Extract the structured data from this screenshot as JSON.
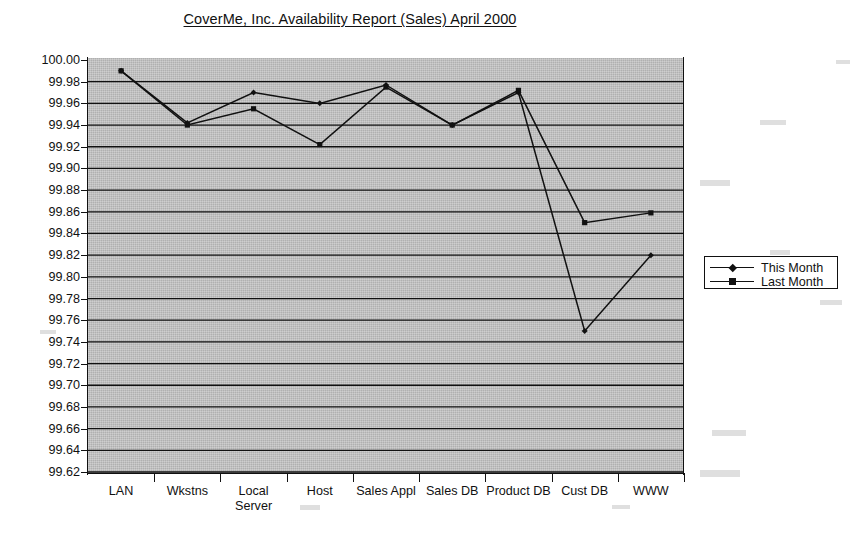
{
  "chart_data": {
    "type": "line",
    "title": "CoverMe, Inc. Availability Report (Sales) April 2000",
    "xlabel": "",
    "ylabel": "",
    "ylim": [
      99.62,
      100.0
    ],
    "ytick_step": 0.02,
    "grid": true,
    "legend_position": "right",
    "categories": [
      "LAN",
      "Wkstns",
      "Local Server",
      "Host",
      "Sales Appl",
      "Sales DB",
      "Product DB",
      "Cust DB",
      "WWW"
    ],
    "category_lines": [
      [
        "LAN"
      ],
      [
        "Wkstns"
      ],
      [
        "Local",
        "Server"
      ],
      [
        "Host"
      ],
      [
        "Sales Appl"
      ],
      [
        "Sales DB"
      ],
      [
        "Product DB"
      ],
      [
        "Cust DB"
      ],
      [
        "WWW"
      ]
    ],
    "ytick_labels": [
      "100.00",
      "99.98",
      "99.96",
      "99.94",
      "99.92",
      "99.90",
      "99.88",
      "99.86",
      "99.84",
      "99.82",
      "99.80",
      "99.78",
      "99.76",
      "99.74",
      "99.72",
      "99.70",
      "99.68",
      "99.66",
      "99.64",
      "99.62"
    ],
    "ytick_values": [
      100.0,
      99.98,
      99.96,
      99.94,
      99.92,
      99.9,
      99.88,
      99.86,
      99.84,
      99.82,
      99.8,
      99.78,
      99.76,
      99.74,
      99.72,
      99.7,
      99.68,
      99.66,
      99.64,
      99.62
    ],
    "series": [
      {
        "name": "This Month",
        "marker": "diamond",
        "color": "#111111",
        "values": [
          99.99,
          99.942,
          99.97,
          99.96,
          99.977,
          99.94,
          99.97,
          99.75,
          99.82
        ]
      },
      {
        "name": "Last Month",
        "marker": "square",
        "color": "#111111",
        "values": [
          99.99,
          99.94,
          99.955,
          99.922,
          99.975,
          99.94,
          99.972,
          99.85,
          99.859
        ]
      }
    ]
  },
  "legend": {
    "entries": [
      {
        "label": "This Month"
      },
      {
        "label": "Last Month"
      }
    ]
  },
  "colors": {
    "plot_background": "#b0b0b0",
    "line": "#111111",
    "axis": "#111111",
    "page_background": "#ffffff"
  }
}
